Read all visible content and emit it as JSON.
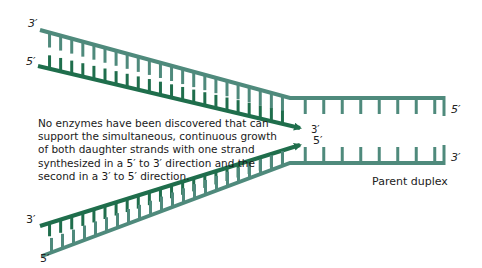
{
  "figure": {
    "caption": "No enzymes have been discovered that can support the simultaneous, continuous growth of both daughter strands with one strand synthesized in a 5′ to 3′ direction and the second in a 3′ to 5′ direction.",
    "parent_label": "Parent duplex",
    "colors": {
      "parent_strand": "#4f8a7c",
      "daughter_strand": "#1f6e4c",
      "text": "#1a1a1a"
    },
    "labels": {
      "top_arm_outer_end": "3′",
      "top_arm_inner_end": "5′",
      "bottom_arm_inner_end": "3′",
      "bottom_arm_outer_end": "5′",
      "fork_top_arrow_tip": "3′",
      "fork_bottom_arrow_tip": "5′",
      "parent_top_end": "5′",
      "parent_bottom_end": "3′"
    }
  }
}
